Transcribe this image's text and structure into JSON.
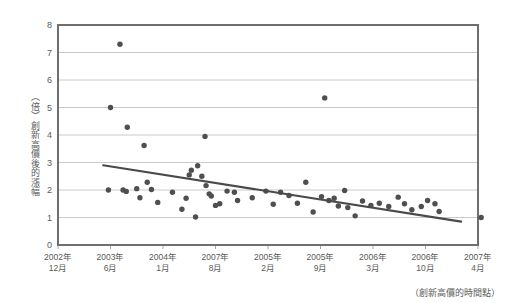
{
  "chart_data": {
    "type": "scatter",
    "title": "",
    "subtitle": "",
    "ylabel": "（倍）創新高價後的漲幅",
    "ylabel_unit": "（倍）",
    "ylabel_text": "創新高價後的漲幅",
    "xlabel": "（創新高價的時間點）",
    "ylim": [
      0,
      8
    ],
    "ytick_values": [
      0,
      1,
      2,
      3,
      4,
      5,
      6,
      7,
      8
    ],
    "ytick_labels": [
      "0",
      "1",
      "2",
      "3",
      "4",
      "5",
      "6",
      "7",
      "8"
    ],
    "xtick_labels": [
      "2002年\n12月",
      "2003年\n6月",
      "2004年\n1月",
      "2007年\n8月",
      "2005年\n2月",
      "2005年\n9月",
      "2006年\n3月",
      "2006年\n10月",
      "2007年\n4月"
    ],
    "xtick_index": [
      0,
      1,
      2,
      3,
      4,
      5,
      6,
      7,
      8
    ],
    "grid": true,
    "grid_axis": "y",
    "legend": "none",
    "marker_color": "#4f4f52",
    "trendline_color": "#4a4a4d",
    "gridline_color": "#bdbdbd",
    "frame_color": "#6f6f6f",
    "series": [
      {
        "name": "創新高價後的漲幅",
        "points": [
          {
            "x": 0.96,
            "y": 2.0
          },
          {
            "x": 1.0,
            "y": 5.0
          },
          {
            "x": 1.18,
            "y": 7.3
          },
          {
            "x": 1.24,
            "y": 2.0
          },
          {
            "x": 1.3,
            "y": 1.95
          },
          {
            "x": 1.32,
            "y": 4.28
          },
          {
            "x": 1.5,
            "y": 2.05
          },
          {
            "x": 1.56,
            "y": 1.72
          },
          {
            "x": 1.64,
            "y": 3.62
          },
          {
            "x": 1.7,
            "y": 2.28
          },
          {
            "x": 1.78,
            "y": 2.02
          },
          {
            "x": 1.9,
            "y": 1.55
          },
          {
            "x": 2.18,
            "y": 1.92
          },
          {
            "x": 2.36,
            "y": 1.3
          },
          {
            "x": 2.44,
            "y": 1.7
          },
          {
            "x": 2.5,
            "y": 2.55
          },
          {
            "x": 2.54,
            "y": 2.72
          },
          {
            "x": 2.62,
            "y": 1.02
          },
          {
            "x": 2.66,
            "y": 2.88
          },
          {
            "x": 2.74,
            "y": 2.5
          },
          {
            "x": 2.8,
            "y": 3.95
          },
          {
            "x": 2.82,
            "y": 2.16
          },
          {
            "x": 2.88,
            "y": 1.86
          },
          {
            "x": 2.92,
            "y": 1.78
          },
          {
            "x": 3.0,
            "y": 1.44
          },
          {
            "x": 3.08,
            "y": 1.5
          },
          {
            "x": 3.22,
            "y": 1.96
          },
          {
            "x": 3.36,
            "y": 1.92
          },
          {
            "x": 3.42,
            "y": 1.62
          },
          {
            "x": 3.7,
            "y": 1.72
          },
          {
            "x": 3.96,
            "y": 1.96
          },
          {
            "x": 4.1,
            "y": 1.48
          },
          {
            "x": 4.24,
            "y": 1.92
          },
          {
            "x": 4.4,
            "y": 1.8
          },
          {
            "x": 4.56,
            "y": 1.52
          },
          {
            "x": 4.72,
            "y": 2.28
          },
          {
            "x": 4.86,
            "y": 1.2
          },
          {
            "x": 5.02,
            "y": 1.76
          },
          {
            "x": 5.08,
            "y": 5.35
          },
          {
            "x": 5.16,
            "y": 1.62
          },
          {
            "x": 5.26,
            "y": 1.7
          },
          {
            "x": 5.34,
            "y": 1.42
          },
          {
            "x": 5.46,
            "y": 1.98
          },
          {
            "x": 5.52,
            "y": 1.36
          },
          {
            "x": 5.66,
            "y": 1.06
          },
          {
            "x": 5.8,
            "y": 1.6
          },
          {
            "x": 5.96,
            "y": 1.44
          },
          {
            "x": 6.12,
            "y": 1.52
          },
          {
            "x": 6.3,
            "y": 1.4
          },
          {
            "x": 6.48,
            "y": 1.74
          },
          {
            "x": 6.6,
            "y": 1.5
          },
          {
            "x": 6.74,
            "y": 1.28
          },
          {
            "x": 6.92,
            "y": 1.4
          },
          {
            "x": 7.04,
            "y": 1.62
          },
          {
            "x": 7.18,
            "y": 1.5
          },
          {
            "x": 7.26,
            "y": 1.22
          },
          {
            "x": 8.06,
            "y": 1.0
          }
        ]
      }
    ],
    "trendline": {
      "name": "趨勢線",
      "x_start": 0.86,
      "y_start": 2.9,
      "x_end": 7.68,
      "y_end": 0.85
    }
  }
}
